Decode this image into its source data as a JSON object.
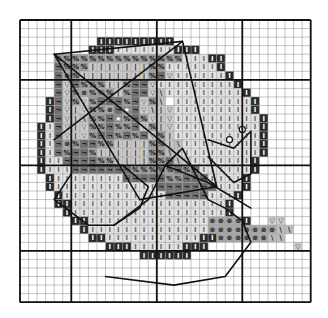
{
  "chart_data": {
    "type": "cross-stitch-pattern",
    "title": "",
    "grid": {
      "origin_px": [
        20,
        20
      ],
      "cell_px": 8.55,
      "cols": 34,
      "rows": 33,
      "major_line_cols": [
        0,
        6,
        16,
        26,
        34
      ],
      "major_line_rows": [
        0,
        7,
        17,
        27,
        33
      ]
    },
    "legend_symbols": {
      ".": {
        "name": "empty",
        "fill": "#ffffff",
        "glyph": ""
      },
      "X": {
        "name": "dark-border",
        "fill": "#2a2a2a",
        "glyph": "I",
        "glyph_color": "#ffffff"
      },
      "I": {
        "name": "light-gray",
        "fill": "#d2d2d2",
        "glyph": "I",
        "glyph_color": "#555555"
      },
      "L": {
        "name": "pale-gray",
        "fill": "#e2e2e2",
        "glyph": "I",
        "glyph_color": "#666666"
      },
      "d": {
        "name": "dark-gray",
        "fill": "#6e6e6e",
        "glyph": "¬",
        "glyph_color": "#111111"
      },
      "s": {
        "name": "mid-gray",
        "fill": "#9a9a9a",
        "glyph": "%",
        "glyph_color": "#111111"
      },
      "b": {
        "name": "bar-light",
        "fill": "#c8c8c8",
        "glyph": "|",
        "glyph_color": "#111111"
      },
      "v": {
        "name": "triangle-light",
        "fill": "#cfcfcf",
        "glyph": "▽",
        "glyph_color": "#333333"
      },
      "k": {
        "name": "backslash-light",
        "fill": "#bdbdbd",
        "glyph": "\\",
        "glyph_color": "#111111"
      },
      "o": {
        "name": "circle-gray",
        "fill": "#a5a5a5",
        "glyph": "⊛",
        "glyph_color": "#222222"
      },
      "w": {
        "name": "star-gray",
        "fill": "#8a8a8a",
        "glyph": "★",
        "glyph_color": "#ffffff"
      }
    },
    "rows": [
      "..................................",
      "..................................",
      ".........XXXXXXXXX................",
      "........XXXLLLLLLLXXX.............",
      "....sssssssssssssssLLLXX..........",
      "....dsssbbbbbbbssLLLLLLX..........",
      "....dosbbbbbbbbsdvLLLLLLX.........",
      "....dvdsssbbsddvLLLLLLLLLX........",
      "....dvsosssbsddvkLLLLLLLLLX.......",
      "...Xdvsvsdddsdvsk\\LLLLLLLLLX......",
      "...XdvbvssodwdvkbvLLLLLLLLLX......",
      "...XdvbkssdwsdsvbvLLLLLLLLLLX.....",
      "..XLdvbvssdssdvsbvLLLLLLLLLLX.....",
      "..XLdvbvsddsdsdvsbLLLLLLLLLLX.....",
      "..XLdosddssbbbbssbkLLLLLLLLLX.....",
      "..XLdsddsbbbbbbsskbLLLLLLLLLX.....",
      "..XLLddddssbbbbssdkvLLLLLLLX......",
      "..XLLLdddddddsssssdsdLLLLLLX......",
      "...XLLLLLLLLdddddssdddLLLLX.......",
      "...XLLLLLLLLLLLLdddddddLLLX.......",
      "....XLLLLLLLLLLLLdddddLLLX........",
      "....XXLLLLLLLLLLLLLLLLLLX.........",
      ".....XLLLLLLLLLLLLLLLLLLX.........",
      "......XXLLLLLLLLLLLLLLooooX..vv...",
      ".......XLLLLLLLLLLLLLLooooooookk..",
      "........XXLLLLLLLLLLLXXooooookk...",
      "..........XXXLLLLLLXXX..........v.",
      "..............XXXXXX..............",
      "..................................",
      "..................................",
      "..................................",
      "..................................",
      ".................................."
    ],
    "overlay_lines": {
      "kite_outline": [
        [
          4,
          4
        ],
        [
          19,
          2.5
        ],
        [
          23,
          19.5
        ],
        [
          14,
          21
        ],
        [
          4,
          4
        ]
      ],
      "kite_cross_1": [
        [
          4,
          4
        ],
        [
          23,
          19.5
        ]
      ],
      "kite_cross_2": [
        [
          19,
          2.5
        ],
        [
          4,
          14
        ]
      ],
      "kite_tail": [
        [
          17,
          17
        ],
        [
          22,
          19
        ],
        [
          27,
          22
        ]
      ],
      "bow_left": [
        [
          6,
          18
        ],
        [
          4,
          21
        ],
        [
          8,
          24
        ],
        [
          11,
          24
        ],
        [
          14,
          22
        ],
        [
          15,
          19.5
        ],
        [
          12,
          17
        ],
        [
          8,
          17
        ]
      ],
      "tail_wave": [
        [
          11,
          24
        ],
        [
          15,
          21
        ],
        [
          17,
          17
        ],
        [
          19,
          15
        ],
        [
          20,
          17
        ],
        [
          22,
          21
        ],
        [
          24,
          22
        ],
        [
          26,
          23.5
        ],
        [
          27,
          26
        ],
        [
          24,
          30
        ],
        [
          18,
          31
        ],
        [
          10,
          30
        ]
      ],
      "butterfly": [
        [
          22,
          14
        ],
        [
          25,
          15
        ],
        [
          27,
          13
        ],
        [
          27,
          18
        ],
        [
          25,
          19
        ],
        [
          22,
          16
        ]
      ]
    },
    "butterfly_antennae_dots": [
      [
        24.5,
        14
      ],
      [
        26,
        12.8
      ]
    ]
  }
}
